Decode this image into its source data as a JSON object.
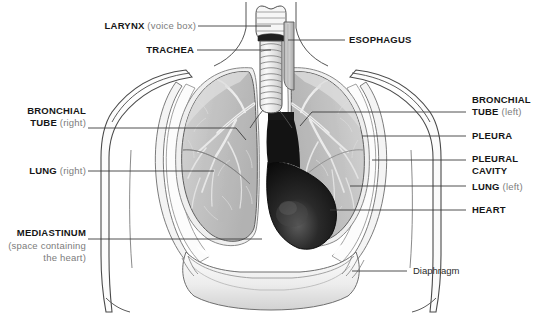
{
  "figure": {
    "background_color": "#ffffff",
    "line_color": "#3a3a3a",
    "label_color": "#161616",
    "sublabel_color": "#7c7c7c",
    "lung_color": "#c2c2c2",
    "heart_color": "#111111",
    "bronchi_color": "#ededed",
    "pleura_color": "#f2f2f2"
  },
  "labels": {
    "larynx": {
      "main": "LARYNX",
      "sub": "(voice box)"
    },
    "trachea": {
      "main": "TRACHEA",
      "sub": ""
    },
    "esophagus": {
      "main": "ESOPHAGUS",
      "sub": ""
    },
    "bronchial_tube_right": {
      "main": "BRONCHIAL",
      "main2": "TUBE",
      "sub": "(right)"
    },
    "bronchial_tube_left": {
      "main": "BRONCHIAL",
      "main2": "TUBE",
      "sub": "(left)"
    },
    "lung_right": {
      "main": "LUNG",
      "sub": "(right)"
    },
    "lung_left": {
      "main": "LUNG",
      "sub": "(left)"
    },
    "pleura": {
      "main": "PLEURA",
      "sub": ""
    },
    "pleural_cavity": {
      "main": "PLEURAL",
      "main2": "CAVITY",
      "sub": ""
    },
    "heart": {
      "main": "HEART",
      "sub": ""
    },
    "mediastinum": {
      "main": "MEDIASTINUM",
      "line2": "(space containing",
      "line3": "the heart)"
    },
    "diaphragm": {
      "main": "Diaphragm",
      "sub": ""
    }
  }
}
